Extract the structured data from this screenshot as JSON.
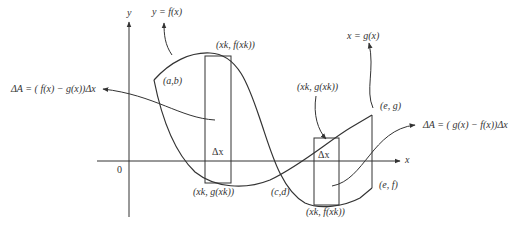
{
  "diagram": {
    "axes": {
      "y_label": "y",
      "x_label": "x",
      "origin_label": "0"
    },
    "curves": {
      "f_label": "y = f(x)",
      "g_label": "x = g(x)"
    },
    "points": {
      "ab": "(a,b)",
      "cd": "(c,d)",
      "eg": "(e, g)",
      "ef": "(e, f)",
      "xk_fxk_top": "(xk, f(xk))",
      "xk_gxk_bottom": "(xk, g(xk))",
      "xk_gxk_top": "(xk, g(xk))",
      "xk_fxk_bottom": "(xk, f(xk))"
    },
    "rectangles": [
      {
        "label": "Δx"
      },
      {
        "label": "Δx"
      }
    ],
    "formulas": {
      "left": "ΔA = ( f(x) − g(x))Δx",
      "right": "ΔA = ( g(x) − f(x))Δx"
    },
    "colors": {
      "stroke": "#333333",
      "background": "#ffffff"
    }
  }
}
